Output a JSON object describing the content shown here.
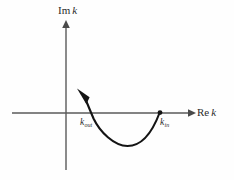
{
  "figure": {
    "background_color": "#fefefe",
    "axis_color": "#5a5a5a",
    "curve_color": "#141414",
    "axes": {
      "vertical": {
        "label_prefix": "Im",
        "label_symbol": "k",
        "label_full": "Im k",
        "name": "imaginary-axis"
      },
      "horizontal": {
        "label_prefix": "Re",
        "label_symbol": "k",
        "label_full": "Re k",
        "name": "real-axis"
      },
      "origin": {
        "x": 66,
        "y": 113
      }
    },
    "markers": [
      {
        "id": "k-out",
        "label_base": "k",
        "label_sub": "out",
        "label_full": "k_out",
        "x": 90,
        "y": 113,
        "has_dot": false
      },
      {
        "id": "k-in",
        "label_base": "k",
        "label_sub": "in",
        "label_full": "k_in",
        "x": 160,
        "y": 113,
        "has_dot": true
      }
    ],
    "contour": {
      "name": "deformed-contour",
      "description": "Curve from k_in on the real axis, dipping into the lower half plane, rising through k_out and ending with an arrowhead in the upper half plane",
      "direction": "from k_in to k_out",
      "start": {
        "x": 160,
        "y": 113
      },
      "minimum": {
        "x": 127,
        "y": 146
      },
      "crossing": {
        "x": 91,
        "y": 113
      },
      "arrow_tip": {
        "x": 77,
        "y": 89
      }
    }
  }
}
